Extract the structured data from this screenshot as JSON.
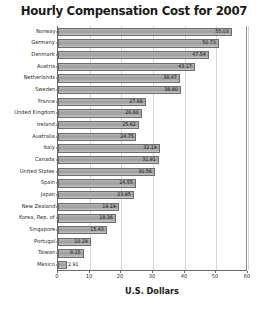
{
  "chart_data": {
    "type": "bar",
    "orientation": "horizontal",
    "title": "Hourly Compensation Cost for 2007",
    "xlabel": "U.S. Dollars",
    "ylabel": "",
    "xlim": [
      0,
      60
    ],
    "xticks": [
      0,
      10,
      20,
      30,
      40,
      50,
      60
    ],
    "grid": true,
    "legend": "none",
    "bar_color": "#a8a8a8",
    "bar_border_color": "#6d6d6d",
    "title_color": "#1b1b1b",
    "categories": [
      "Norway",
      "Germany",
      "Denmark",
      "Austria",
      "Netherlands",
      "Sweden",
      "France",
      "United Kingdom",
      "Ireland",
      "Australia",
      "Italy",
      "Canada",
      "United States",
      "Spain",
      "Japan",
      "New Zealand",
      "Korea, Rep. of",
      "Singapore",
      "Portugal",
      "Taiwan",
      "Mexico"
    ],
    "values": [
      55.03,
      50.73,
      47.54,
      43.17,
      38.47,
      38.8,
      27.68,
      26.6,
      25.62,
      24.75,
      32.19,
      31.91,
      30.56,
      24.55,
      23.95,
      19.19,
      18.36,
      15.43,
      10.29,
      8.15,
      2.91
    ],
    "value_labels": [
      "55.03",
      "50.73",
      "47.54",
      "43.17",
      "38.47",
      "38.80",
      "27.68",
      "26.60",
      "25.62",
      "24.75",
      "32.19",
      "31.91",
      "30.56",
      "24.55",
      "23.95",
      "19.19",
      "18.36",
      "15.43",
      "10.29",
      "8.15",
      "2.91"
    ]
  }
}
